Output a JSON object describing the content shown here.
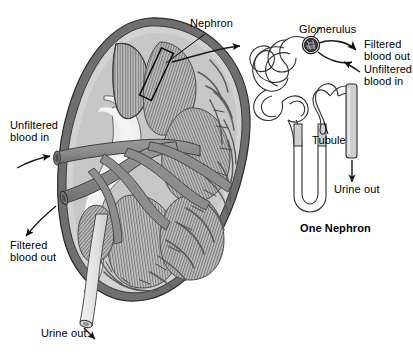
{
  "figure": {
    "title_caption": "One Nephron",
    "background_color": "#ffffff",
    "ink_color": "#000000"
  },
  "labels": {
    "nephron": "Nephron",
    "glomerulus": "Glomerulus",
    "filtered_blood_out_right_l1": "Filtered",
    "filtered_blood_out_right_l2": "blood out",
    "unfiltered_blood_in_right_l1": "Unfiltered",
    "unfiltered_blood_in_right_l2": "blood in",
    "unfiltered_blood_in_left_l1": "Unfiltered",
    "unfiltered_blood_in_left_l2": "blood in",
    "filtered_blood_out_left_l1": "Filtered",
    "filtered_blood_out_left_l2": "blood out",
    "urine_out_kidney": "Urine out",
    "tubule": "Tubule",
    "urine_out_nephron": "Urine out",
    "one_nephron_caption": "One Nephron"
  },
  "colors": {
    "capsule_dark": "#6f6f6f",
    "cortex_light": "#d2d2d2",
    "pyramid_fill": "#bdbdbd",
    "pyramid_stripe": "#6d6d6d",
    "pelvis_light": "#ececec",
    "vessel_gray": "#8d8d8d",
    "vessel_dark": "#5e5e5e",
    "ureter_light": "#e2e2e2",
    "glomerulus_dark": "#3a3a3a",
    "tubule_fill": "#fbfbfb",
    "duct_fill": "#cfcfcf",
    "outline": "#1a1a1a"
  },
  "diagram": {
    "type": "anatomical-illustration",
    "parts": [
      "renal capsule",
      "renal cortex",
      "renal pyramids",
      "renal pelvis",
      "renal artery",
      "renal vein",
      "ureter",
      "glomerulus",
      "convoluted tubule",
      "loop of henle",
      "collecting duct"
    ]
  }
}
